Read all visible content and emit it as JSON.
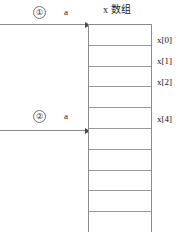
{
  "diagram": {
    "header": {
      "array_title": "x 数组"
    },
    "pointers": [
      {
        "marker": "①",
        "name": "a",
        "label_top": 6,
        "line_y": 24
      },
      {
        "marker": "②",
        "name": "a",
        "label_top": 110,
        "line_y": 130
      }
    ],
    "array": {
      "cell_count": 10,
      "cell_height": 20.8,
      "top": 24,
      "left": 88,
      "width": 64,
      "height": 208
    },
    "index_labels": [
      {
        "text": "x[0]",
        "top": 35
      },
      {
        "text": "x[1]",
        "top": 56
      },
      {
        "text": "x[2]",
        "top": 77
      },
      {
        "text": "x[4]",
        "top": 114
      }
    ],
    "colors": {
      "line": "#8a8a8a",
      "divider": "#9a9a9a",
      "arrow": "#8c8c8c",
      "arrow_head": "#4a4a4a",
      "text": "#111111",
      "background": "#ffffff"
    }
  }
}
